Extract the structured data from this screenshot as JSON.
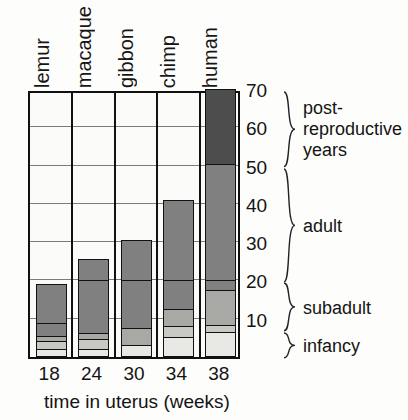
{
  "chart_data": {
    "type": "bar",
    "title": "",
    "subtitle": "",
    "xlabel": "time in uterus (weeks)",
    "ylabel": "",
    "categories": [
      "lemur",
      "macaque",
      "gibbon",
      "chimp",
      "human"
    ],
    "x": [
      18,
      24,
      30,
      34,
      38
    ],
    "x_tick_labels": [
      "18",
      "24",
      "30",
      "34",
      "38"
    ],
    "y_tick_labels": [
      "70",
      "60",
      "50",
      "40",
      "30",
      "20",
      "10"
    ],
    "y_ticks": [
      70,
      60,
      50,
      40,
      30,
      20,
      10
    ],
    "ylim": [
      0,
      70
    ],
    "grid": true,
    "legend_position": "right-braces",
    "stage_bands": [
      {
        "name": "post-reproductive years",
        "from": 50,
        "to": 70,
        "lines": [
          "post-",
          "reproductive",
          "years"
        ]
      },
      {
        "name": "adult",
        "from": 20,
        "to": 50,
        "lines": [
          "adult"
        ]
      },
      {
        "name": "subadult",
        "from": 7,
        "to": 20,
        "lines": [
          "subadult"
        ]
      },
      {
        "name": "infancy",
        "from": 0,
        "to": 7,
        "lines": [
          "infancy"
        ]
      }
    ],
    "series": [
      {
        "name": "lemur",
        "gestation_weeks": 18,
        "lifespan_years": 19,
        "segments": [
          {
            "stage": "infancy",
            "from": 0,
            "to": 2.2,
            "shade": "lightest"
          },
          {
            "stage": "infancy-late",
            "from": 2.2,
            "to": 4.2,
            "shade": "light"
          },
          {
            "stage": "subadult",
            "from": 4.2,
            "to": 5.6,
            "shade": "medium"
          },
          {
            "stage": "subadult-late",
            "from": 5.6,
            "to": 9.0,
            "shade": "dark"
          },
          {
            "stage": "adult",
            "from": 9.0,
            "to": 19.0,
            "shade": "dark"
          }
        ]
      },
      {
        "name": "macaque",
        "gestation_weeks": 24,
        "lifespan_years": 25.5,
        "segments": [
          {
            "stage": "infancy",
            "from": 0,
            "to": 2.0,
            "shade": "lightest"
          },
          {
            "stage": "infancy-late",
            "from": 2.0,
            "to": 4.8,
            "shade": "light"
          },
          {
            "stage": "subadult",
            "from": 4.8,
            "to": 6.4,
            "shade": "medium"
          },
          {
            "stage": "subadult-late",
            "from": 6.4,
            "to": 20.0,
            "shade": "dark"
          },
          {
            "stage": "adult",
            "from": 20.0,
            "to": 25.5,
            "shade": "dark"
          }
        ]
      },
      {
        "name": "gibbon",
        "gestation_weeks": 30,
        "lifespan_years": 30.5,
        "segments": [
          {
            "stage": "infancy",
            "from": 0,
            "to": 3.2,
            "shade": "lightest"
          },
          {
            "stage": "infancy-late",
            "from": 3.2,
            "to": 7.6,
            "shade": "medium"
          },
          {
            "stage": "subadult",
            "from": 7.6,
            "to": 20.0,
            "shade": "dark"
          },
          {
            "stage": "adult",
            "from": 20.0,
            "to": 30.5,
            "shade": "dark"
          }
        ]
      },
      {
        "name": "chimp",
        "gestation_weeks": 34,
        "lifespan_years": 41.0,
        "segments": [
          {
            "stage": "infancy",
            "from": 0,
            "to": 5.2,
            "shade": "lightest"
          },
          {
            "stage": "infancy-late",
            "from": 5.2,
            "to": 8.2,
            "shade": "light"
          },
          {
            "stage": "subadult",
            "from": 8.2,
            "to": 12.5,
            "shade": "medium"
          },
          {
            "stage": "subadult-late",
            "from": 12.5,
            "to": 20.0,
            "shade": "dark"
          },
          {
            "stage": "adult",
            "from": 20.0,
            "to": 41.0,
            "shade": "dark"
          }
        ]
      },
      {
        "name": "human",
        "gestation_weeks": 38,
        "lifespan_years": 70.0,
        "segments": [
          {
            "stage": "infancy",
            "from": 0,
            "to": 6.5,
            "shade": "lightest"
          },
          {
            "stage": "infancy-late",
            "from": 6.5,
            "to": 8.4,
            "shade": "light"
          },
          {
            "stage": "subadult",
            "from": 8.4,
            "to": 17.5,
            "shade": "medium"
          },
          {
            "stage": "subadult-late",
            "from": 17.5,
            "to": 20.0,
            "shade": "dark"
          },
          {
            "stage": "adult",
            "from": 20.0,
            "to": 50.5,
            "shade": "dark"
          },
          {
            "stage": "post-reproductive",
            "from": 50.5,
            "to": 70.0,
            "shade": "darkest"
          }
        ]
      }
    ],
    "shades": {
      "lightest": "#e8e8e4",
      "light": "#c9c9c4",
      "medium": "#a8a8a4",
      "dark": "#808080",
      "darkest": "#4d4d4d",
      "empty": "#fbfbf9"
    }
  },
  "axes": {
    "plot_left_px": 28,
    "plot_top_px": 91,
    "plot_width_px": 212,
    "plot_height_px": 268
  }
}
